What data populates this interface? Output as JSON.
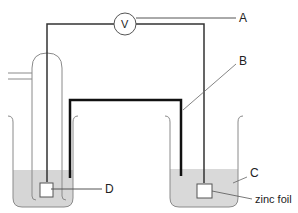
{
  "diagram": {
    "type": "electrochemical cell",
    "voltmeter": {
      "symbol": "V"
    },
    "labels": {
      "A": "A",
      "B": "B",
      "C": "C",
      "D": "D",
      "zinc_foil": "zinc foil"
    },
    "colors": {
      "solution": "#d9d9d9",
      "wire": "#333333",
      "salt_bridge": "#111111",
      "glass": "#8a8a8a"
    }
  }
}
